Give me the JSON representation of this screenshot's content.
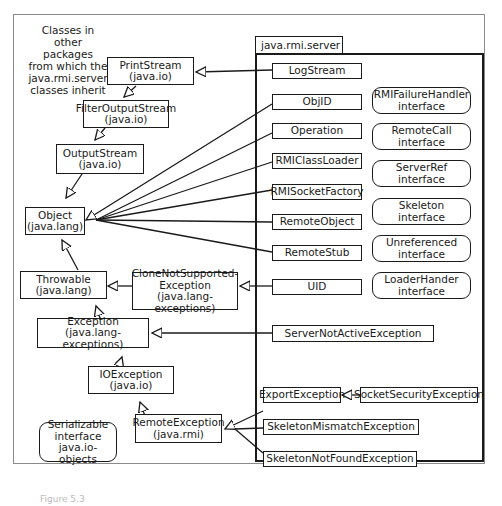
{
  "note": {
    "lines": [
      "Classes in",
      "other packages",
      "from which the",
      "java.rmi.server",
      "classes inherit"
    ]
  },
  "package": {
    "name": "java.rmi.server"
  },
  "external_classes": {
    "print_stream": {
      "name": "PrintStream",
      "pkg": "(java.io)"
    },
    "filter_output_stream": {
      "name": "FilterOutputStream",
      "pkg": "(java.io)"
    },
    "output_stream": {
      "name": "OutputStream",
      "pkg": "(java.io)"
    },
    "object": {
      "name": "Object",
      "pkg": "(java.lang)"
    },
    "throwable": {
      "name": "Throwable",
      "pkg": "(java.lang)"
    },
    "clone_not_supported": {
      "name1": "CloneNotSupported-",
      "name2": "Exception",
      "pkg": "(java.lang-exceptions)"
    },
    "exception": {
      "name": "Exception",
      "pkg": "(java.lang-exceptions)"
    },
    "io_exception": {
      "name": "IOException",
      "pkg": "(java.io)"
    },
    "remote_exception": {
      "name": "RemoteException",
      "pkg": "(java.rmi)"
    },
    "serializable": {
      "name": "Serializable",
      "kind": "interface",
      "pkg": "java.io-objects"
    }
  },
  "server_classes": [
    {
      "id": "logstream",
      "name": "LogStream"
    },
    {
      "id": "objid",
      "name": "ObjID"
    },
    {
      "id": "operation",
      "name": "Operation"
    },
    {
      "id": "rmiclassloader",
      "name": "RMIClassLoader"
    },
    {
      "id": "rmisocketfactory",
      "name": "RMISocketFactory"
    },
    {
      "id": "remoteobject",
      "name": "RemoteObject"
    },
    {
      "id": "remotestub",
      "name": "RemoteStub"
    },
    {
      "id": "uid",
      "name": "UID"
    },
    {
      "id": "servernotactive",
      "name": "ServerNotActiveException"
    },
    {
      "id": "exportexception",
      "name": "ExportException"
    },
    {
      "id": "socketsecurity",
      "name": "SocketSecurityException"
    },
    {
      "id": "skeletonmismatch",
      "name": "SkeletonMismatchException"
    },
    {
      "id": "skeletonnotfound",
      "name": "SkeletonNotFoundException"
    }
  ],
  "server_interfaces": [
    {
      "name": "RMIFailureHandler",
      "kind": "interface"
    },
    {
      "name": "RemoteCall",
      "kind": "interface"
    },
    {
      "name": "ServerRef",
      "kind": "interface"
    },
    {
      "name": "Skeleton",
      "kind": "interface"
    },
    {
      "name": "Unreferenced",
      "kind": "interface"
    },
    {
      "name": "LoaderHander",
      "kind": "interface"
    }
  ],
  "caption": "Figure 5.3"
}
